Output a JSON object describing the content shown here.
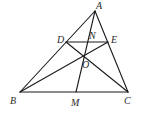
{
  "diagram": {
    "type": "geometry",
    "points": {
      "A": {
        "label": "A",
        "x": 95,
        "y": 11,
        "lx": 96,
        "ly": 9
      },
      "B": {
        "label": "B",
        "x": 20,
        "y": 92,
        "lx": 10,
        "ly": 104
      },
      "C": {
        "label": "C",
        "x": 128,
        "y": 92,
        "lx": 124,
        "ly": 104
      },
      "D": {
        "label": "D",
        "x": 66,
        "y": 42,
        "lx": 57,
        "ly": 43
      },
      "E": {
        "label": "E",
        "x": 108,
        "y": 42,
        "lx": 111,
        "ly": 43
      },
      "N": {
        "label": "N",
        "x": 89,
        "y": 42,
        "lx": 89,
        "ly": 39
      },
      "O": {
        "label": "O",
        "x": 84,
        "y": 56,
        "lx": 82,
        "ly": 68
      },
      "M": {
        "label": "M",
        "x": 76,
        "y": 92,
        "lx": 71,
        "ly": 106
      }
    },
    "segments": [
      [
        "A",
        "B"
      ],
      [
        "A",
        "C"
      ],
      [
        "B",
        "C"
      ],
      [
        "D",
        "E"
      ],
      [
        "B",
        "E"
      ],
      [
        "C",
        "D"
      ],
      [
        "A",
        "M"
      ]
    ],
    "stroke_color": "#1a1a1a"
  }
}
